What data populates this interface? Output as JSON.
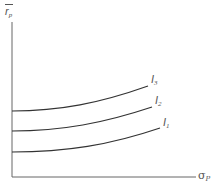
{
  "diagram": {
    "y_axis_label": {
      "main": "r",
      "sub": "p",
      "overbar": true
    },
    "x_axis_label": {
      "main": "σ",
      "sub": "P"
    },
    "curves": [
      {
        "name": "I3",
        "main": "I",
        "sub": "3"
      },
      {
        "name": "I2",
        "main": "I",
        "sub": "2"
      },
      {
        "name": "I1",
        "main": "I",
        "sub": "1"
      }
    ],
    "colors": {
      "axis": "#555555",
      "curve": "#333333",
      "text": "#555555"
    }
  }
}
